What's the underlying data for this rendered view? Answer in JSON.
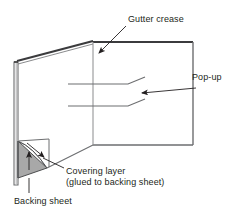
{
  "figure": {
    "labels": {
      "gutter_crease": "Gutter crease",
      "popup": "Pop-up",
      "covering_layer_line1": "Covering layer",
      "covering_layer_line2": "(glued to backing sheet)",
      "backing_sheet": "Backing sheet"
    },
    "colors": {
      "stroke": "#58595b",
      "stroke_dark": "#3b3b3d",
      "text": "#231f20",
      "triangle_fill": "#a8a8a8",
      "background": "#ffffff"
    },
    "parts": [
      {
        "id": "backing-sheet-edge",
        "name": "Backing sheet",
        "shape": "narrow vertical strip at the left side of the card"
      },
      {
        "id": "covering-layer-panel",
        "name": "Covering layer",
        "shape": "large quadrilateral panel seen in perspective, glued to the backing sheet"
      },
      {
        "id": "gutter-crease-line",
        "name": "Gutter crease",
        "shape": "vertical fold line where the left panel meets the right panel"
      },
      {
        "id": "popup-slits",
        "name": "Pop-up",
        "shape": "two horizontal cut lines with angled tabs forming the pop-up step"
      },
      {
        "id": "peeled-corner",
        "name": "Peeled corner of covering layer",
        "shape": "shaded triangle at the lower left showing the covering layer lifted away"
      }
    ]
  }
}
